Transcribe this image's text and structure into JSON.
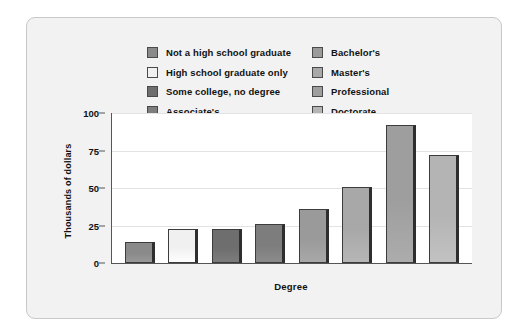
{
  "figure": {
    "panel_background": "#f2f2f2",
    "plot_background": "#ffffff"
  },
  "legend": {
    "columns": [
      [
        {
          "label": "Not a high school graduate",
          "color": "#8a8a8a"
        },
        {
          "label": "High school graduate only",
          "color": "#f0f0f0"
        },
        {
          "label": "Some college, no degree",
          "color": "#6e6e6e"
        },
        {
          "label": "Associate's",
          "color": "#7d7d7d"
        }
      ],
      [
        {
          "label": "Bachelor's",
          "color": "#9a9a9a"
        },
        {
          "label": "Master's",
          "color": "#a8a8a8"
        },
        {
          "label": "Professional",
          "color": "#9e9e9e"
        },
        {
          "label": "Doctorate",
          "color": "#b4b4b4"
        }
      ]
    ]
  },
  "chart_data": {
    "type": "bar",
    "title": "",
    "xlabel": "Degree",
    "ylabel": "Thousands of dollars",
    "categories": [
      "Not a high school graduate",
      "High school graduate only",
      "Some college, no degree",
      "Associate's",
      "Bachelor's",
      "Master's",
      "Professional",
      "Doctorate"
    ],
    "values": [
      14,
      23,
      23,
      26,
      36,
      51,
      92,
      72
    ],
    "colors": [
      "#8a8a8a",
      "#f0f0f0",
      "#6e6e6e",
      "#7d7d7d",
      "#9a9a9a",
      "#a8a8a8",
      "#9e9e9e",
      "#b4b4b4"
    ],
    "ylim": [
      0,
      100
    ],
    "yticks": [
      0,
      25,
      50,
      75,
      100
    ],
    "ytick_labels": [
      "0",
      "25",
      "50",
      "75",
      "100"
    ],
    "grid": true,
    "legend_position": "top"
  }
}
